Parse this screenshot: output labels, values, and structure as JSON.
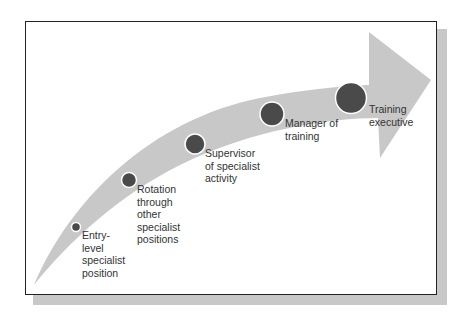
{
  "diagram": {
    "type": "career-path-arrow",
    "colors": {
      "arrow": "#c8c8c8",
      "node": "#4a4a4a",
      "node_ring": "#ffffff",
      "frame": "#222222",
      "shadow": "#c8c8c8",
      "text": "#333333"
    },
    "stages": [
      {
        "label": "Entry-\nlevel\nspecialist\nposition"
      },
      {
        "label": "Rotation\nthrough\nother\nspecialist\npositions"
      },
      {
        "label": "Supervisor\nof specialist\nactivity"
      },
      {
        "label": "Manager of\ntraining"
      },
      {
        "label": "Training\nexecutive"
      }
    ]
  }
}
